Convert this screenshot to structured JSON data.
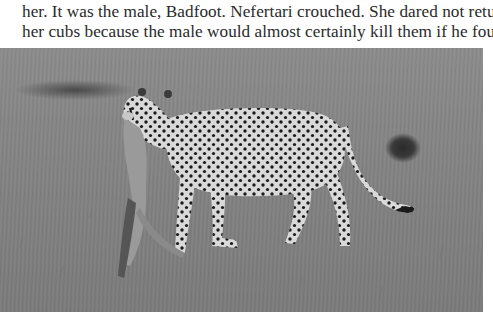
{
  "document": {
    "paragraph_lines": [
      "her. It was the male, Badfoot. Nefertari crouched. She dared not return to",
      "her cubs because the male would almost certainly kill them if he found"
    ]
  },
  "photo": {
    "subject": "cheetah-carrying-prey",
    "description": "Black-and-white photograph of a cheetah walking across grassland carrying a small prey animal in its mouth",
    "tone": "grayscale"
  }
}
